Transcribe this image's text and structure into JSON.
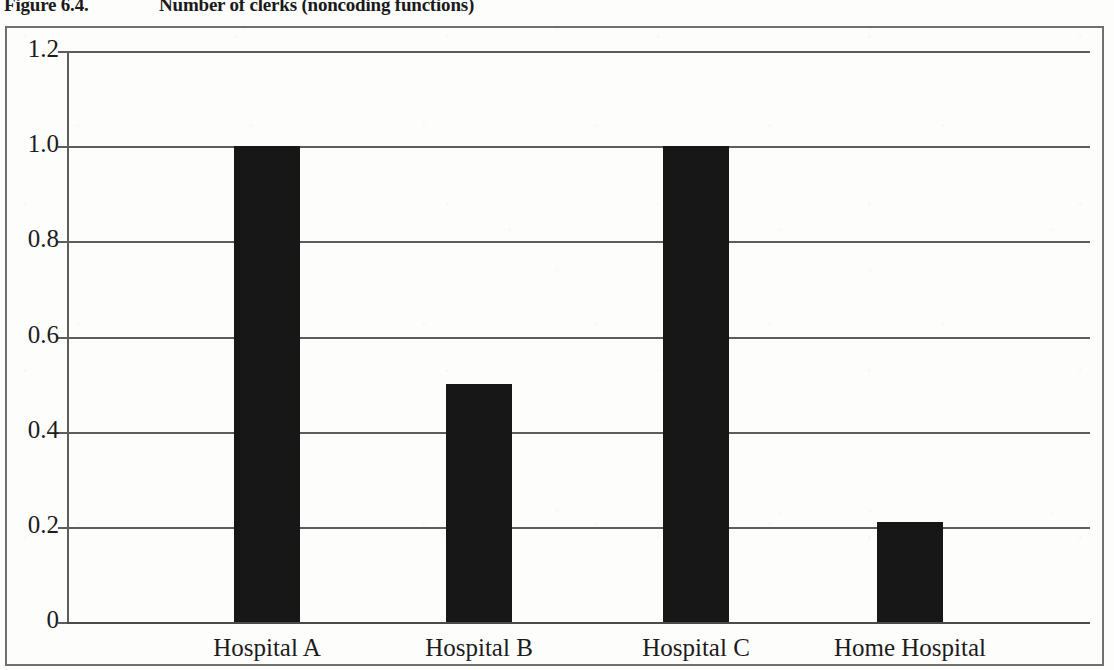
{
  "caption": {
    "label": "Figure 6.4.",
    "title": "Number of clerks (noncoding functions)"
  },
  "chart_data": {
    "type": "bar",
    "title": "Number of clerks (noncoding functions)",
    "categories": [
      "Hospital A",
      "Hospital B",
      "Hospital C",
      "Home Hospital"
    ],
    "values": [
      1.0,
      0.5,
      1.0,
      0.21
    ],
    "xlabel": "",
    "ylabel": "",
    "ylim": [
      0,
      1.2
    ],
    "ytick_labels": [
      "1.2",
      "1.0",
      "0.8",
      "0.6",
      "0.4",
      "0.2",
      "0"
    ],
    "ytick_values": [
      1.2,
      1.0,
      0.8,
      0.6,
      0.4,
      0.2,
      0
    ],
    "grid": true,
    "legend": false,
    "bar_color": "#171717",
    "axis_color": "#5d5d5d"
  }
}
